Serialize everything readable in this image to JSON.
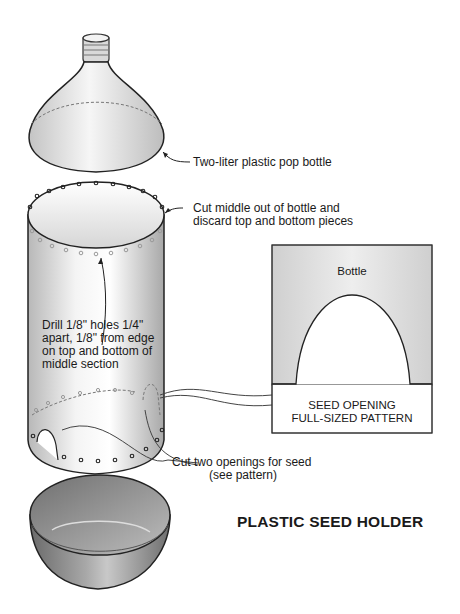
{
  "title": "PLASTIC SEED HOLDER",
  "callouts": {
    "bottle": "Two-liter plastic pop bottle",
    "cut_middle_line1": "Cut middle out of bottle and",
    "cut_middle_line2": "discard top and bottom pieces",
    "drill_line1": "Drill 1/8\" holes 1/4\"",
    "drill_line2": "apart, 1/8\" from edge",
    "drill_line3": "on top and bottom of",
    "drill_line4": "middle section",
    "openings_line1": "Cut two openings for seed",
    "openings_line2": "(see pattern)"
  },
  "pattern": {
    "top_label": "Bottle",
    "caption_line1": "SEED OPENING",
    "caption_line2": "FULL-SIZED PATTERN"
  },
  "parts": [
    {
      "name": "bottle-top",
      "description": "top of bottle with cap threads (discarded)"
    },
    {
      "name": "middle-section",
      "description": "cylinder with drilled holes and seed openings"
    },
    {
      "name": "bottle-base",
      "description": "bottom cup (seed tray)"
    }
  ]
}
